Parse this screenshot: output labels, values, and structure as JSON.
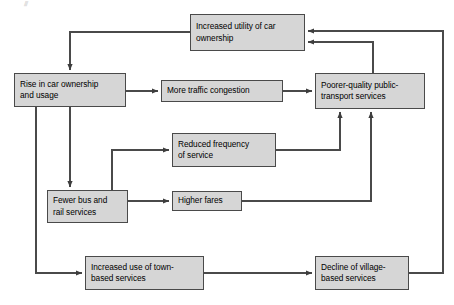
{
  "diagram": {
    "type": "flowchart",
    "colors": {
      "box_fill": "#d6d6d6",
      "box_border": "#4a4a4a",
      "connector": "#4a4a4a",
      "text": "#000000",
      "background": "#ffffff"
    },
    "nodes": [
      {
        "id": "car-utility",
        "label": "Increased utility of car ownership",
        "line1": "Increased utility of car",
        "line2": "ownership"
      },
      {
        "id": "car-ownership",
        "label": "Rise in car ownership and usage",
        "line1": "Rise in car ownership",
        "line2": "and usage"
      },
      {
        "id": "traffic-congestion",
        "label": "More traffic congestion",
        "line1": "More traffic congestion",
        "line2": ""
      },
      {
        "id": "poorer-quality",
        "label": "Poorer-quality public-transport services",
        "line1": "Poorer-quality public-",
        "line2": "transport services"
      },
      {
        "id": "reduced-frequency",
        "label": "Reduced frequency of service",
        "line1": "Reduced frequency",
        "line2": "of service"
      },
      {
        "id": "fewer-bus-rail",
        "label": "Fewer bus and rail services",
        "line1": "Fewer bus and",
        "line2": "rail services"
      },
      {
        "id": "higher-fares",
        "label": "Higher fares",
        "line1": "Higher fares",
        "line2": ""
      },
      {
        "id": "town-services",
        "label": "Increased use of town-based services",
        "line1": "Increased use of town-",
        "line2": "based services"
      },
      {
        "id": "village-services",
        "label": "Decline of village-based services",
        "line1": "Decline of village-",
        "line2": "based services"
      }
    ],
    "edges": [
      {
        "from": "car-utility",
        "to": "car-ownership"
      },
      {
        "from": "car-ownership",
        "to": "traffic-congestion"
      },
      {
        "from": "car-ownership",
        "to": "fewer-bus-rail"
      },
      {
        "from": "car-ownership",
        "to": "town-services"
      },
      {
        "from": "traffic-congestion",
        "to": "poorer-quality"
      },
      {
        "from": "fewer-bus-rail",
        "to": "reduced-frequency"
      },
      {
        "from": "fewer-bus-rail",
        "to": "higher-fares"
      },
      {
        "from": "reduced-frequency",
        "to": "poorer-quality"
      },
      {
        "from": "higher-fares",
        "to": "poorer-quality"
      },
      {
        "from": "poorer-quality",
        "to": "car-utility"
      },
      {
        "from": "town-services",
        "to": "village-services"
      },
      {
        "from": "village-services",
        "to": "car-utility"
      }
    ],
    "artifact_mark": "⫻"
  }
}
